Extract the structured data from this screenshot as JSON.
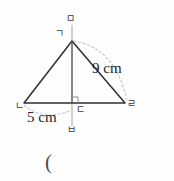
{
  "figure": {
    "kind": "geometry-diagram",
    "background_color": "#fefefe",
    "stroke_color": "#2f2f2f",
    "guide_color": "#b9b9b9",
    "dash_color": "#c2c2c2",
    "text_color": "#232323",
    "vertices": {
      "apex": {
        "label": "ㄱ",
        "name": "giyeok",
        "x": 72,
        "y": 41
      },
      "base_left": {
        "label": "ㄴ",
        "name": "nieun",
        "x": 24,
        "y": 103
      },
      "base_mid": {
        "label": "ㄷ",
        "name": "digeut",
        "x": 72,
        "y": 103
      },
      "base_right": {
        "label": "ㄹ",
        "name": "rieul",
        "x": 125,
        "y": 103
      },
      "line_top": {
        "label": "ㅁ",
        "name": "mieum",
        "x": 72,
        "y": 25
      },
      "line_bottom": {
        "label": "ㅂ",
        "name": "bieup",
        "x": 72,
        "y": 126
      }
    },
    "dimensions": [
      {
        "id": "slant",
        "value": "9 cm",
        "number": 9,
        "unit": "cm",
        "measures": "apex-to-base-right"
      },
      {
        "id": "half-base",
        "value": "5 cm",
        "number": 5,
        "unit": "cm",
        "measures": "base-left-to-base-mid"
      }
    ],
    "annotations": {
      "right_angle_mark": true,
      "arc_right": true,
      "arc_left": true
    },
    "footer_text": "("
  }
}
